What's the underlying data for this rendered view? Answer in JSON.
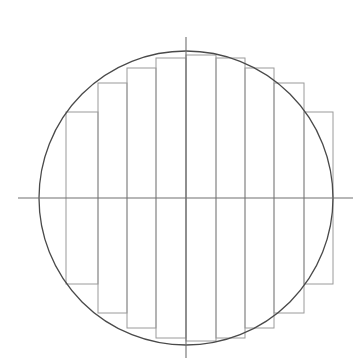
{
  "figure": {
    "canvas": {
      "width": 364,
      "height": 363,
      "background": "#ffffff"
    }
  },
  "chart_data": {
    "type": "diagram",
    "xlabel": "",
    "ylabel": "",
    "grid": false,
    "legend": null,
    "xlim": [
      0,
      364
    ],
    "ylim": [
      0,
      363
    ],
    "circle": {
      "label": "circle",
      "cx": 186,
      "cy": 198,
      "r": 147,
      "stroke": "#4a4a4a",
      "stroke_width": 1.3,
      "fill": "none"
    },
    "axes": {
      "horizontal": {
        "label": "horizontal-axis",
        "x1": 18,
        "y1": 198,
        "x2": 353,
        "y2": 198,
        "stroke": "#707070",
        "stroke_width": 1.1
      },
      "vertical": {
        "label": "vertical-axis",
        "x1": 186,
        "y1": 37,
        "x2": 186,
        "y2": 358,
        "stroke": "#707070",
        "stroke_width": 1.1
      }
    },
    "rectangles": {
      "count": 10,
      "stroke": "#9a9a9a",
      "stroke_width": 1.0,
      "fill": "none",
      "boundaries_x": [
        66,
        98,
        127,
        156,
        186,
        216,
        245,
        274,
        304,
        333
      ],
      "items": [
        {
          "index": 1,
          "x": 66,
          "width": 32,
          "top": 112,
          "bottom": 284,
          "height": 172
        },
        {
          "index": 2,
          "x": 98,
          "width": 29,
          "top": 83,
          "bottom": 313,
          "height": 230
        },
        {
          "index": 3,
          "x": 127,
          "width": 29,
          "top": 68,
          "bottom": 328,
          "height": 260
        },
        {
          "index": 4,
          "x": 156,
          "width": 30,
          "top": 58,
          "bottom": 338,
          "height": 280
        },
        {
          "index": 5,
          "x": 186,
          "width": 30,
          "top": 55,
          "bottom": 341,
          "height": 286
        },
        {
          "index": 6,
          "x": 216,
          "width": 29,
          "top": 58,
          "bottom": 338,
          "height": 280
        },
        {
          "index": 7,
          "x": 245,
          "width": 29,
          "top": 68,
          "bottom": 328,
          "height": 260
        },
        {
          "index": 8,
          "x": 274,
          "width": 30,
          "top": 83,
          "bottom": 313,
          "height": 230
        },
        {
          "index": 9,
          "x": 304,
          "width": 29,
          "top": 112,
          "bottom": 284,
          "height": 172
        }
      ]
    }
  }
}
